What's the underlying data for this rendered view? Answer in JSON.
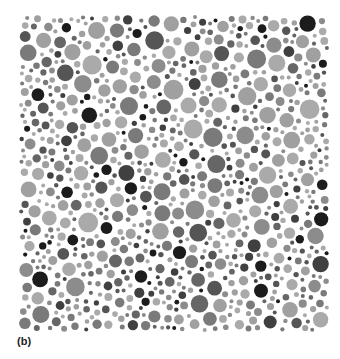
{
  "figure": {
    "panel_label": "(b)",
    "bounds": {
      "x0": 19,
      "y0": 15,
      "x1": 329,
      "y1": 332
    },
    "seed": 1337,
    "radius_range": [
      2,
      10
    ],
    "gap": 1.6,
    "attempts": 26000,
    "shades": [
      "#aaaaaa",
      "#a0a0a0",
      "#8c8c8c",
      "#7a7a7a",
      "#666666",
      "#555555",
      "#404040",
      "#1c1c1c"
    ],
    "shade_weights": [
      22,
      16,
      12,
      14,
      10,
      10,
      8,
      6
    ],
    "background": "#ffffff"
  }
}
